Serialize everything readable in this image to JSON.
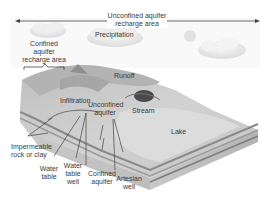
{
  "diagram": {
    "colors": {
      "sky": "#f4f4f4",
      "cloud": "#e6e6e6",
      "land_top": "#c9c9c9",
      "land_light": "#dedede",
      "cross_section": "#bdbdbd",
      "aquifer_band": "#8c8c8c",
      "water": "#d8d8d8",
      "label_text": "#3a3a3a",
      "leader_line": "#2a2a2a"
    },
    "labels": {
      "unconfined_recharge": [
        "Unconfined aquifer",
        "recharge area"
      ],
      "precipitation": "Precipitation",
      "confined_recharge": [
        "Confined",
        "aquifer",
        "recharge area"
      ],
      "runoff": "Runoff",
      "infiltration": "Infiltration",
      "unconfined_aquifer": [
        "Unconfined",
        "aquifer"
      ],
      "stream": "Stream",
      "lake": "Lake",
      "impermeable": [
        "Impermeable",
        "rock or clay"
      ],
      "water_table": [
        "Water",
        "table"
      ],
      "water_table_well": [
        "Water",
        "table",
        "well"
      ],
      "confined_aquifer": [
        "Confined",
        "aquifer"
      ],
      "artesian_well": [
        "Artesian",
        "well"
      ]
    }
  }
}
